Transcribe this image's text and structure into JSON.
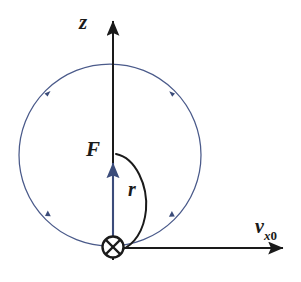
{
  "figure": {
    "background_color": "#ffffff"
  },
  "labels": {
    "z_axis": "z",
    "force": "F",
    "radius": "r",
    "velocity_symbol": "v",
    "velocity_sub_x": "x",
    "velocity_sub_zero": "0"
  },
  "colors": {
    "axis": "#1a1a1a",
    "orbit": "#4a5a8a",
    "force_arrow": "#3b4c7a",
    "label": "#1a1a1a"
  },
  "geometry": {
    "origin": {
      "x": 113,
      "y": 247
    },
    "orbit_circle": {
      "cx": 110,
      "cy": 155,
      "r": 91
    },
    "cross_marker": {
      "cx": 113,
      "cy": 247,
      "r": 11
    },
    "z_axis": {
      "x": 113,
      "y_top": 18,
      "y_bottom": 260
    },
    "x_axis": {
      "y": 248,
      "x_left": 113,
      "x_right": 287
    },
    "force_arrow": {
      "x": 113,
      "y_tail": 243,
      "y_head": 159
    },
    "radius_arc": {
      "start": [
        116,
        155
      ],
      "end": [
        120,
        250
      ],
      "bulge_x": 147
    }
  },
  "annotations": {
    "cross_meaning": "vector into page",
    "orbit_direction": "clockwise"
  }
}
